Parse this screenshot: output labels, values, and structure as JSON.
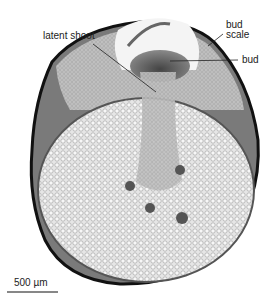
{
  "figure": {
    "labels": {
      "latent_shoot": "latent shoot",
      "bud_scale_line1": "bud",
      "bud_scale_line2": "scale",
      "bud": "bud"
    },
    "scale_bar": {
      "text": "500 µm"
    },
    "colors": {
      "tissue_light": "#d9d9d9",
      "tissue_mid": "#9a9a9a",
      "tissue_dark": "#3a3a3a",
      "epidermis": "#111111"
    }
  }
}
